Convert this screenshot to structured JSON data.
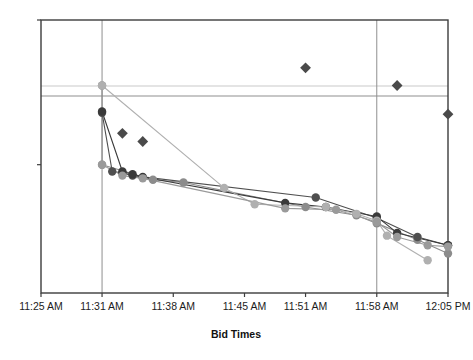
{
  "chart_data": {
    "type": "line",
    "title": "",
    "subtitle": "",
    "xlabel": "Bid Times",
    "ylabel": "",
    "grid": true,
    "grid_horizontal_count": 2,
    "grid_vertical_count": 2,
    "legend": "none",
    "xlim": [
      0,
      40
    ],
    "ylim": [
      0,
      100
    ],
    "x_tick_labels": [
      "11:25 AM",
      "11:31 AM",
      "11:38 AM",
      "11:45 AM",
      "11:51 AM",
      "11:58 AM",
      "12:05 PM"
    ],
    "x_tick_values": [
      0,
      6,
      13,
      20,
      26,
      33,
      40
    ],
    "y_tick_labels": [
      "",
      ""
    ],
    "y_tick_values": [
      47,
      100
    ],
    "series": [
      {
        "name": "bidder-1",
        "kind": "line",
        "color": "#8c8c8c",
        "marker": "circle",
        "x": [
          6,
          6,
          11,
          14,
          26,
          31,
          33,
          37,
          40
        ],
        "y": [
          76.0,
          47.0,
          41.5,
          40.5,
          31.5,
          28.5,
          25.5,
          19.5,
          14.5
        ]
      },
      {
        "name": "bidder-2",
        "kind": "line",
        "color": "#4f4f4f",
        "marker": "circle",
        "x": [
          6,
          7,
          8,
          9,
          27,
          33,
          37,
          40
        ],
        "y": [
          66.0,
          44.5,
          44.0,
          43.0,
          35.0,
          27.5,
          20.5,
          17.5
        ]
      },
      {
        "name": "bidder-3",
        "kind": "line",
        "color": "#3a3a3a",
        "marker": "circle",
        "x": [
          6,
          8,
          9,
          10,
          24,
          28,
          33,
          35,
          40
        ],
        "y": [
          66.5,
          44.5,
          43.5,
          42.5,
          33.0,
          31.5,
          28.0,
          22.0,
          17.5
        ]
      },
      {
        "name": "bidder-4",
        "kind": "line",
        "color": "#b0b0b0",
        "marker": "circle",
        "x": [
          6,
          18,
          21,
          28,
          31,
          33,
          34,
          38
        ],
        "y": [
          76.0,
          38.5,
          32.5,
          31.5,
          29.0,
          26.5,
          21.0,
          12.0
        ]
      },
      {
        "name": "bidder-5",
        "kind": "line",
        "color": "#9a9a9a",
        "marker": "circle",
        "x": [
          6,
          8,
          10,
          24,
          29,
          33,
          35,
          38,
          40
        ],
        "y": [
          47.0,
          43.0,
          42.0,
          31.0,
          30.5,
          26.0,
          20.5,
          17.5,
          17.0
        ]
      },
      {
        "name": "accepted-bids",
        "kind": "scatter",
        "color": "#4a4a4a",
        "marker": "diamond",
        "x": [
          8,
          10,
          26,
          35,
          40
        ],
        "y": [
          58.5,
          55.5,
          82.5,
          76.0,
          65.5
        ]
      }
    ],
    "annotations": []
  },
  "axis": {
    "x_title": "Bid Times"
  },
  "colors": {
    "plot_border": "#3d3d3d",
    "grid_light": "#c9c9c9",
    "grid_dark": "#8f8f8f",
    "background": "#ffffff",
    "marker_dark": "#3a3a3a",
    "marker_mid": "#8c8c8c",
    "marker_light": "#b0b0b0",
    "diamond": "#4a4a4a",
    "tick_text": "#1c1c1c"
  }
}
